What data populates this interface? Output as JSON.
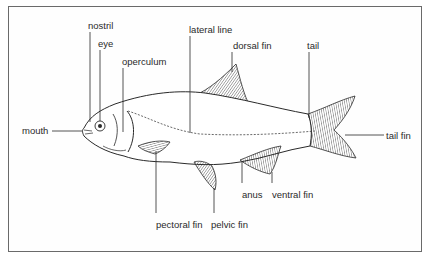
{
  "diagram": {
    "type": "labeled-anatomy",
    "labels": [
      {
        "id": "nostril",
        "text": "nostril"
      },
      {
        "id": "eye",
        "text": "eye"
      },
      {
        "id": "operculum",
        "text": "operculum"
      },
      {
        "id": "lateral_line",
        "text": "lateral line"
      },
      {
        "id": "dorsal_fin",
        "text": "dorsal fin"
      },
      {
        "id": "tail",
        "text": "tail"
      },
      {
        "id": "mouth",
        "text": "mouth"
      },
      {
        "id": "tail_fin",
        "text": "tail fin"
      },
      {
        "id": "anus",
        "text": "anus"
      },
      {
        "id": "ventral_fin",
        "text": "ventral fin"
      },
      {
        "id": "pectoral_fin",
        "text": "pectoral fin"
      },
      {
        "id": "pelvic_fin",
        "text": "pelvic fin"
      }
    ]
  },
  "colors": {
    "line": "#2a2a2a",
    "frame": "#6a6a6a",
    "background": "#ffffff"
  }
}
